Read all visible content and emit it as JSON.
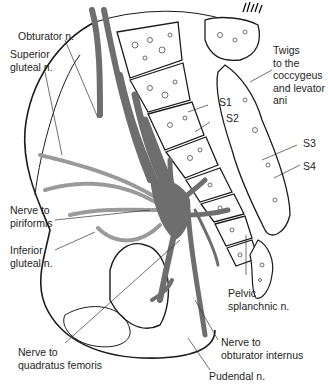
{
  "figure": {
    "colors": {
      "nerve": "#6e6e6e",
      "nerve_outline": "#2a2a2a",
      "dashed_nerve": "#b5b5b5",
      "bone_outline": "#1c1c1c",
      "background": "#ffffff",
      "text": "#1e1e1e"
    }
  },
  "labels": {
    "obturator": "Obturator n.",
    "superior_gluteal": "Superior\ngluteal n.",
    "twigs": "Twigs\nto the\ncoccygeus\nand levator\nani",
    "s1": "S1",
    "s2": "S2",
    "s3": "S3",
    "s4": "S4",
    "nerve_to_piriformis": "Nerve to\npiriformis",
    "inferior_gluteal": "Inferior\ngluteal n.",
    "pelvic_splanchnic": "Pelvic\nsplanchnic n.",
    "nerve_to_obturator_internus": "Nerve to\nobturator internus",
    "nerve_to_quadratus_femoris": "Nerve to\nquadratus femoris",
    "pudendal": "Pudendal n."
  }
}
